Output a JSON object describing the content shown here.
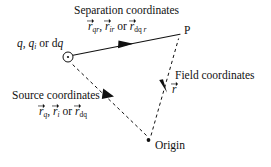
{
  "figure": {
    "background_color": "#ffffff",
    "ink_color": "#111111",
    "width": 271,
    "height": 167
  },
  "labels": {
    "separation_title": "Separation coordinates",
    "separation_symbols": {
      "v1_letter": "r",
      "v1_sub": "qr",
      "sep1": ", ",
      "v2_letter": "r",
      "v2_sub": "ir",
      "conj": " or ",
      "v3_letter": "r",
      "v3_sub_upright": "dq",
      "v3_sub_italic": " r"
    },
    "charge": {
      "q": "q",
      "comma": ", ",
      "qi_letter": "q",
      "qi_sub": "i",
      "conj": " or ",
      "dq_d": "d",
      "dq_q": "q"
    },
    "point_p": "P",
    "field_title": "Field coordinates",
    "field_symbol": {
      "letter": "r"
    },
    "source_title": "Source coordinates",
    "source_symbols": {
      "v1_letter": "r",
      "v1_sub": "q",
      "sep1": ", ",
      "v2_letter": "r",
      "v2_sub": "i",
      "conj": " or ",
      "v3_letter": "r",
      "v3_sub_upright": "dq"
    },
    "origin": "Origin"
  },
  "geometry": {
    "charge_node": {
      "cx": 68,
      "cy": 57,
      "r": 5
    },
    "point_p_node": {
      "x": 180,
      "y": 34
    },
    "origin_node": {
      "cx": 148.5,
      "cy": 140,
      "r": 1.9
    },
    "separation_vector": {
      "x1": 73,
      "y1": 55,
      "x2": 180,
      "y2": 34,
      "style": "solid",
      "arrow_at": [
        127,
        44
      ]
    },
    "source_vector": {
      "x1": 146,
      "y1": 136,
      "x2": 70,
      "y2": 63,
      "style": "dashed",
      "arrow_at": [
        110,
        95
      ]
    },
    "field_vector": {
      "x1": 151,
      "y1": 135,
      "x2": 179,
      "y2": 38,
      "style": "dashed",
      "arrow_at": [
        163.5,
        87
      ]
    }
  }
}
